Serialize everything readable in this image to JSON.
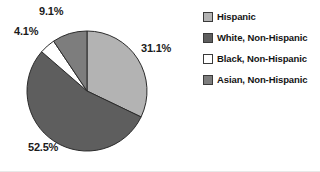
{
  "chart_data": {
    "type": "pie",
    "title": "",
    "categories": [
      "Hispanic",
      "White, Non-Hispanic",
      "Black, Non-Hispanic",
      "Asian, Non-Hispanic"
    ],
    "values": [
      31.1,
      52.5,
      4.1,
      9.1
    ],
    "value_labels": [
      "31.1%",
      "52.5%",
      "4.1%",
      "9.1%"
    ],
    "units": "percent",
    "colors": [
      "#b3b3b3",
      "#5e5e5e",
      "#ffffff",
      "#7d7d7d"
    ],
    "slice_border_color": "#2b2b2b",
    "start_angle_deg": 0,
    "direction": "clockwise",
    "legend": {
      "position": "right",
      "entries": [
        {
          "label": "Hispanic",
          "color": "#b3b3b3"
        },
        {
          "label": "White, Non-Hispanic",
          "color": "#5e5e5e"
        },
        {
          "label": "Black, Non-Hispanic",
          "color": "#ffffff"
        },
        {
          "label": "Asian, Non-Hispanic",
          "color": "#7d7d7d"
        }
      ]
    },
    "grid": false,
    "xlabel": "",
    "ylabel": ""
  },
  "labels": {
    "hispanic": "31.1%",
    "white": "52.5%",
    "black": "4.1%",
    "asian": "9.1%"
  }
}
